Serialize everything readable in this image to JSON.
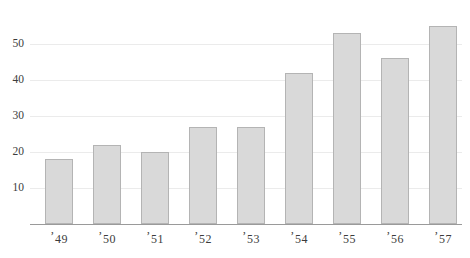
{
  "chart_data": {
    "type": "bar",
    "title": "",
    "subtitle": "",
    "xlabel": "",
    "ylabel": "",
    "categories": [
      "'49",
      "'50",
      "'51",
      "'52",
      "'53",
      "'54",
      "'55",
      "'56",
      "'57"
    ],
    "values": [
      18,
      22,
      20,
      27,
      27,
      42,
      53,
      46,
      55
    ],
    "ylim": [
      0,
      57
    ],
    "yticks": [
      10,
      20,
      30,
      40,
      50
    ],
    "ytick_labels": [
      "10",
      "20",
      "30",
      "40",
      "50"
    ],
    "grid": true,
    "legend": false,
    "legend_position": "none",
    "bar_fill_color": "#d9d9d9",
    "bar_edge_color": "#b4b4b4",
    "gridline_color": "#ebebeb",
    "axis_color": "#9a9a9a",
    "text_color": "#3c3c3c",
    "background_color": "#ffffff"
  },
  "axes": {
    "y": {
      "ticks": [
        {
          "label": "50",
          "value": 50
        },
        {
          "label": "40",
          "value": 40
        },
        {
          "label": "30",
          "value": 30
        },
        {
          "label": "20",
          "value": 20
        },
        {
          "label": "10",
          "value": 10
        }
      ]
    },
    "x": {
      "ticks": [
        {
          "label": "'49"
        },
        {
          "label": "'50"
        },
        {
          "label": "'51"
        },
        {
          "label": "'52"
        },
        {
          "label": "'53"
        },
        {
          "label": "'54"
        },
        {
          "label": "'55"
        },
        {
          "label": "'56"
        },
        {
          "label": "'57"
        }
      ]
    }
  }
}
